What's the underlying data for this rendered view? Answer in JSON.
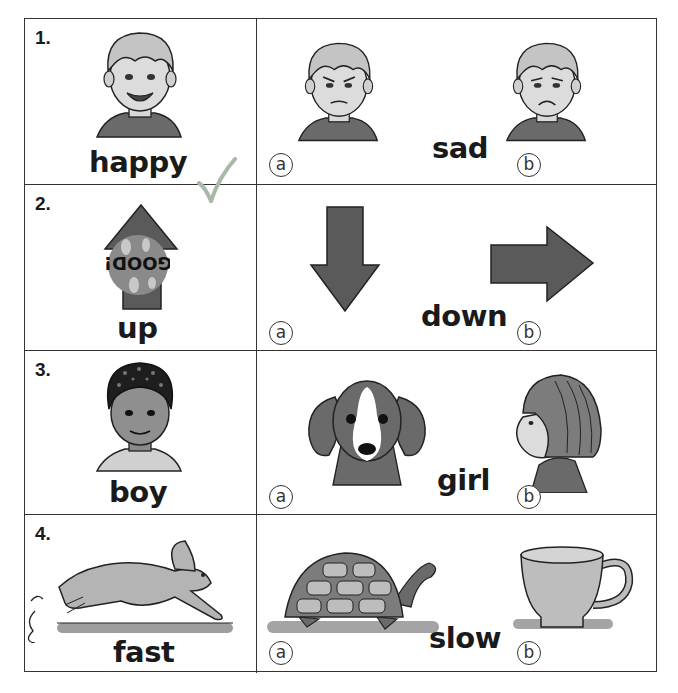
{
  "worksheet": {
    "instructions": "Circle the picture that shows the opposite of each word.",
    "rows": [
      {
        "number": "1.",
        "word": "happy",
        "word_picture": "happy-boy-face",
        "check_mark": "✓",
        "check_color": "#9aa89a",
        "opposite_word": "sad",
        "choices": [
          {
            "label": "a",
            "picture": "angry-boy-face"
          },
          {
            "label": "b",
            "picture": "sad-boy-face"
          }
        ]
      },
      {
        "number": "2.",
        "word": "up",
        "word_picture": "up-arrow",
        "sticker_text": "GOOD!",
        "opposite_word": "down",
        "choices": [
          {
            "label": "a",
            "picture": "down-arrow"
          },
          {
            "label": "b",
            "picture": "right-arrow"
          }
        ]
      },
      {
        "number": "3.",
        "word": "boy",
        "word_picture": "boy-face",
        "opposite_word": "girl",
        "choices": [
          {
            "label": "a",
            "picture": "puppy-face"
          },
          {
            "label": "b",
            "picture": "girl-profile"
          }
        ]
      },
      {
        "number": "4.",
        "word": "fast",
        "word_picture": "running-rabbit",
        "opposite_word": "slow",
        "choices": [
          {
            "label": "a",
            "picture": "turtle"
          },
          {
            "label": "b",
            "picture": "teacup"
          }
        ]
      }
    ]
  },
  "colors": {
    "border": "#333333",
    "fill_dark": "#5a5a5a",
    "fill_mid": "#9a9a9a",
    "fill_light": "#cfcfcf",
    "skin_light": "#d9d9d9"
  }
}
